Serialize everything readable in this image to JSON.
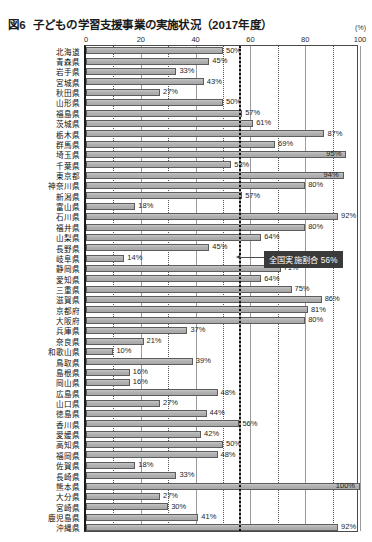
{
  "title": {
    "figure_no": "図6",
    "text": "子どもの学習支援事業の実施状況（2017年度）"
  },
  "unit": "(%)",
  "annotation": {
    "label": "全国実施割合 56%",
    "value": 56
  },
  "chart_data": {
    "type": "bar",
    "orientation": "horizontal",
    "xlabel": "(%)",
    "ylabel": "",
    "xlim": [
      0,
      100
    ],
    "xticks": [
      0,
      20,
      40,
      60,
      80,
      100
    ],
    "grid": true,
    "legend": "none",
    "reference_line": {
      "label": "全国実施割合 56%",
      "value": 56,
      "style": "dotted"
    },
    "categories": [
      "北海道",
      "青森県",
      "岩手県",
      "宮城県",
      "秋田県",
      "山形県",
      "福島県",
      "茨城県",
      "栃木県",
      "群馬県",
      "埼玉県",
      "千葉県",
      "東京都",
      "神奈川県",
      "新潟県",
      "富山県",
      "石川県",
      "福井県",
      "山梨県",
      "長野県",
      "岐阜県",
      "静岡県",
      "愛知県",
      "三重県",
      "滋賀県",
      "京都府",
      "大阪府",
      "兵庫県",
      "奈良県",
      "和歌山県",
      "鳥取県",
      "島根県",
      "岡山県",
      "広島県",
      "山口県",
      "徳島県",
      "香川県",
      "愛媛県",
      "高知県",
      "福岡県",
      "佐賀県",
      "長崎県",
      "熊本県",
      "大分県",
      "宮崎県",
      "鹿児島県",
      "沖縄県"
    ],
    "values": [
      50,
      45,
      33,
      43,
      27,
      50,
      57,
      61,
      87,
      69,
      95,
      53,
      94,
      80,
      57,
      18,
      92,
      80,
      64,
      45,
      14,
      71,
      64,
      75,
      86,
      81,
      80,
      37,
      21,
      10,
      39,
      16,
      16,
      48,
      27,
      44,
      56,
      42,
      50,
      48,
      18,
      33,
      100,
      27,
      30,
      41,
      92
    ],
    "value_labels": [
      "50%",
      "45%",
      "33%",
      "43%",
      "27%",
      "50%",
      "57%",
      "61%",
      "87%",
      "69%",
      "95%",
      "53%",
      "94%",
      "80%",
      "57%",
      "18%",
      "92%",
      "80%",
      "64%",
      "45%",
      "14%",
      "71%",
      "64%",
      "75%",
      "86%",
      "81%",
      "80%",
      "37%",
      "21%",
      "10%",
      "39%",
      "16%",
      "16%",
      "48%",
      "27%",
      "44%",
      "56%",
      "42%",
      "50%",
      "48%",
      "18%",
      "33%",
      "100%",
      "27%",
      "30%",
      "41%",
      "92%"
    ]
  },
  "colors": {
    "bar_fill": "#b3b3b3",
    "bar_border": "#5c5c5c",
    "callout_bg": "#3a3a3a",
    "callout_text": "#ffffff",
    "grid": "#9a9a9a",
    "axis": "#1a1a1a"
  }
}
